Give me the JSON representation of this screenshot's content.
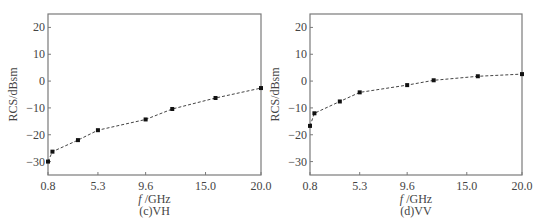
{
  "chart_data": [
    {
      "type": "line",
      "title": "(c)VH",
      "xlabel": "f /GHz",
      "ylabel": "RCS/dBsm",
      "xlim": [
        0.8,
        20.0
      ],
      "ylim": [
        -35,
        25
      ],
      "xticks": [
        0.8,
        5.3,
        9.6,
        15.0,
        20.0
      ],
      "xtick_labels": [
        "0.8",
        "5.3",
        "9.6",
        "15.0",
        "20.0"
      ],
      "yticks": [
        20,
        10,
        0,
        -10,
        -20,
        -30
      ],
      "ytick_labels": [
        "20",
        "10",
        "0",
        "−10",
        "−20",
        "−30"
      ],
      "grid": false,
      "legend": null,
      "series": [
        {
          "name": "VH",
          "style": "dashed line with square markers",
          "x": [
            0.8,
            1.2,
            3.5,
            5.3,
            9.6,
            12.0,
            15.9,
            20.0
          ],
          "y": [
            -30.0,
            -26.3,
            -22.0,
            -18.3,
            -14.3,
            -10.4,
            -6.3,
            -2.6
          ]
        }
      ]
    },
    {
      "type": "line",
      "title": "(d)VV",
      "xlabel": "f /GHz",
      "ylabel": "RCS/dBsm",
      "xlim": [
        0.8,
        20.0
      ],
      "ylim": [
        -35,
        25
      ],
      "xticks": [
        0.8,
        5.3,
        9.6,
        15.0,
        20.0
      ],
      "xtick_labels": [
        "0.8",
        "5.3",
        "9.6",
        "15.0",
        "20.0"
      ],
      "yticks": [
        20,
        10,
        0,
        -10,
        -20,
        -30
      ],
      "ytick_labels": [
        "20",
        "10",
        "0",
        "−10",
        "−20",
        "−30"
      ],
      "grid": false,
      "legend": null,
      "series": [
        {
          "name": "VV",
          "style": "dashed line with square markers",
          "x": [
            0.8,
            1.2,
            3.5,
            5.3,
            9.6,
            12.0,
            16.0,
            20.0
          ],
          "y": [
            -16.7,
            -12.0,
            -7.6,
            -4.2,
            -1.5,
            0.3,
            1.8,
            2.6
          ]
        }
      ]
    }
  ],
  "colors": {
    "axis": "#7a7a7a",
    "line": "#444444",
    "marker": "#111111",
    "text": "#444444"
  }
}
